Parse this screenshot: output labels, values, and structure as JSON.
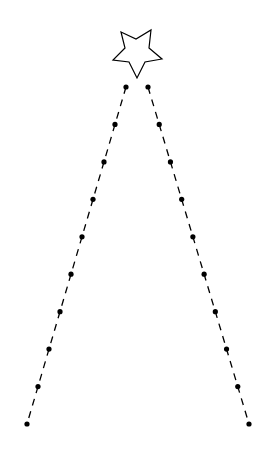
{
  "figure": {
    "colors": {
      "background": "#ffffff",
      "stroke": "#000000",
      "star_fill": "#ffffff",
      "dot_fill": "#000000"
    },
    "star": {
      "icon": "star-outline-icon"
    },
    "strings": [
      {
        "name": "left-string",
        "dot_count": 10
      },
      {
        "name": "right-string",
        "dot_count": 10
      }
    ]
  }
}
